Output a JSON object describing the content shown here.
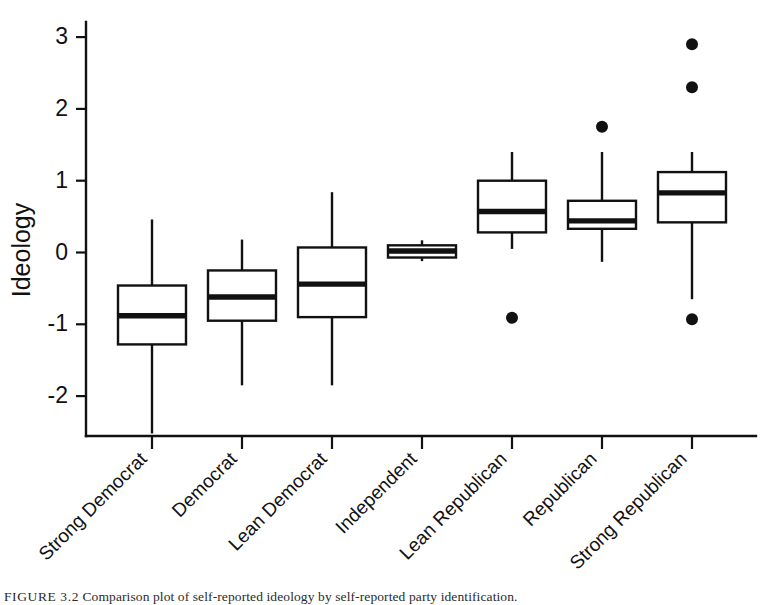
{
  "figure": {
    "caption_label": "FIGURE 3.2",
    "caption_text": "Comparison plot of self-reported ideology by self-reported party identification."
  },
  "chart_data": {
    "type": "box",
    "title": "",
    "xlabel": "",
    "ylabel": "Ideology",
    "ylim": [
      -2.6,
      3.25
    ],
    "yticks": [
      3,
      2,
      1,
      0,
      -1,
      -2
    ],
    "ytick_labels": [
      "3",
      "2",
      "1",
      "0",
      "-1",
      "-2"
    ],
    "grid": false,
    "legend": "none",
    "categories": [
      "Strong Democrat",
      "Democrat",
      "Lean Democrat",
      "Independent",
      "Lean Republican",
      "Republican",
      "Strong Republican"
    ],
    "boxes": [
      {
        "category": "Strong Democrat",
        "whisker_low": -2.52,
        "q1": -1.28,
        "median": -0.88,
        "q3": -0.46,
        "whisker_high": 0.46,
        "outliers": []
      },
      {
        "category": "Democrat",
        "whisker_low": -1.85,
        "q1": -0.95,
        "median": -0.62,
        "q3": -0.25,
        "whisker_high": 0.18,
        "outliers": []
      },
      {
        "category": "Lean Democrat",
        "whisker_low": -1.85,
        "q1": -0.9,
        "median": -0.44,
        "q3": 0.07,
        "whisker_high": 0.84,
        "outliers": []
      },
      {
        "category": "Independent",
        "whisker_low": -0.12,
        "q1": -0.07,
        "median": 0.02,
        "q3": 0.1,
        "whisker_high": 0.17,
        "outliers": []
      },
      {
        "category": "Lean Republican",
        "whisker_low": 0.05,
        "q1": 0.28,
        "median": 0.57,
        "q3": 1.0,
        "whisker_high": 1.4,
        "outliers": [
          -0.91
        ]
      },
      {
        "category": "Republican",
        "whisker_low": -0.13,
        "q1": 0.33,
        "median": 0.44,
        "q3": 0.72,
        "whisker_high": 1.4,
        "outliers": [
          1.75
        ]
      },
      {
        "category": "Strong Republican",
        "whisker_low": -0.65,
        "q1": 0.42,
        "median": 0.83,
        "q3": 1.12,
        "whisker_high": 1.4,
        "outliers": [
          2.9,
          2.3,
          -0.93
        ]
      }
    ]
  }
}
